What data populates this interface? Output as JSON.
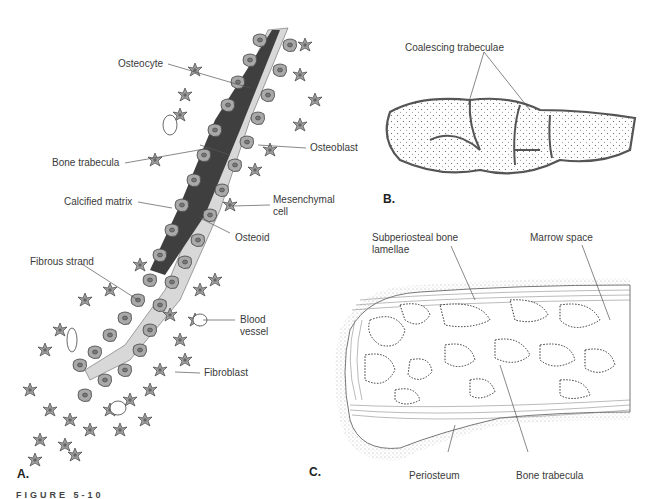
{
  "figure": {
    "caption": "FIGURE 5-10",
    "panels": [
      {
        "id": "A",
        "label": "A.",
        "annotations": [
          {
            "text": "Osteocyte"
          },
          {
            "text": "Bone trabecula"
          },
          {
            "text": "Osteoblast"
          },
          {
            "text": "Calcified matrix"
          },
          {
            "text": "Mesenchymal cell",
            "line1": "Mesenchymal",
            "line2": "cell"
          },
          {
            "text": "Osteoid"
          },
          {
            "text": "Fibrous strand"
          },
          {
            "text": "Blood vessel",
            "line1": "Blood",
            "line2": "vessel"
          },
          {
            "text": "Fibroblast"
          }
        ]
      },
      {
        "id": "B",
        "label": "B.",
        "annotations": [
          {
            "text": "Coalescing trabeculae"
          }
        ]
      },
      {
        "id": "C",
        "label": "C.",
        "annotations": [
          {
            "text": "Subperiosteal bone lamellae",
            "line1": "Subperiosteal bone",
            "line2": "lamellae"
          },
          {
            "text": "Marrow space"
          },
          {
            "text": "Periosteum"
          },
          {
            "text": "Bone trabecula"
          }
        ]
      }
    ]
  },
  "colors": {
    "bone_dark": "#3f3f3f",
    "cell_fill": "#a9a9a9",
    "osteoid": "#d8d8d8",
    "line": "#555555"
  }
}
